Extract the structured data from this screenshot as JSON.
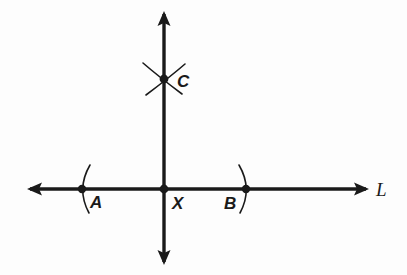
{
  "figure": {
    "kind": "geometry-construction-diagram",
    "background_color": "#fdfdfd",
    "ink_color": "#1a1a1a",
    "width": 407,
    "height": 275
  },
  "lines": {
    "horizontal": {
      "name": "L",
      "label": "L",
      "label_x": 376,
      "label_y": 196,
      "y": 189,
      "x_start": 30,
      "x_end": 366,
      "arrow_left": true,
      "arrow_right": true,
      "stroke_width": 3.4
    },
    "vertical": {
      "name": "perpendicular",
      "label": "",
      "x": 164,
      "y_start": 14,
      "y_end": 262,
      "arrow_top": true,
      "arrow_bottom": true,
      "stroke_width": 3.4
    }
  },
  "points": [
    {
      "id": "A",
      "label": "A",
      "x": 82,
      "y": 189,
      "dot_radius": 4.2,
      "label_x": 90,
      "label_y": 208,
      "arc": {
        "description": "compass arc through A, bulging left",
        "d": "M 90 165 Q 76 189 89 213"
      }
    },
    {
      "id": "X",
      "label": "X",
      "x": 164,
      "y": 189,
      "dot_radius": 4.4,
      "label_x": 172,
      "label_y": 209,
      "arc": null
    },
    {
      "id": "B",
      "label": "B",
      "x": 246,
      "y": 189,
      "dot_radius": 4.2,
      "label_x": 224,
      "label_y": 209,
      "arc": {
        "description": "compass arc through B, bulging right",
        "d": "M 239 165 Q 253 189 240 213"
      }
    },
    {
      "id": "C",
      "label": "C",
      "x": 164,
      "y": 79,
      "dot_radius": 4.4,
      "label_x": 177,
      "label_y": 87,
      "arc": null
    }
  ],
  "arc_intersection": {
    "at_point": "C",
    "description": "two compass arcs crossing at C forming an X mark",
    "strokes": [
      {
        "name": "arc-from-A",
        "d": "M 143 63 Q 158 76 182 94"
      },
      {
        "name": "arc-from-B",
        "d": "M 185 64 Q 170 77 146 95"
      }
    ],
    "stroke_width": 1.5
  },
  "arrowheads": {
    "size": 11,
    "width": 9
  }
}
